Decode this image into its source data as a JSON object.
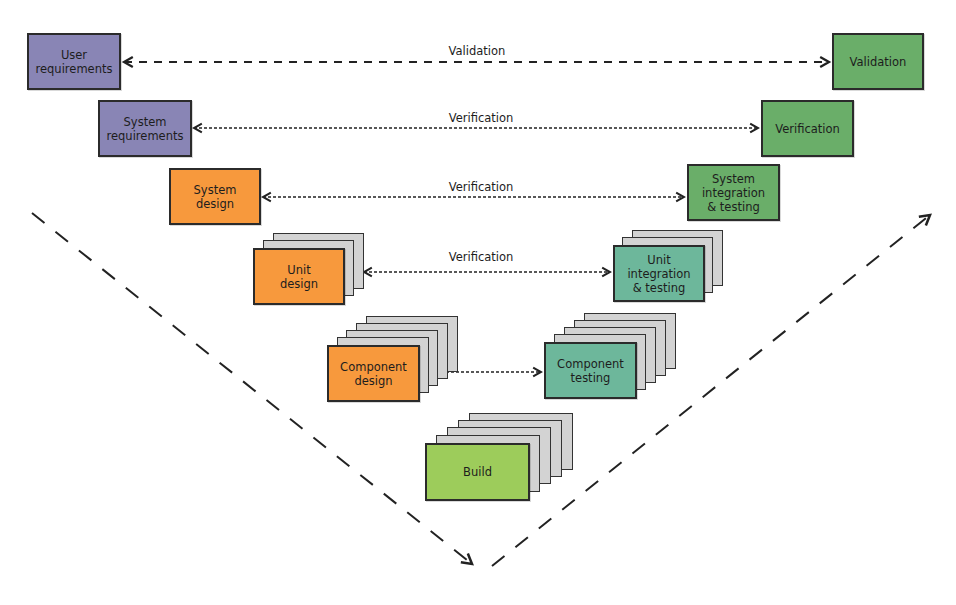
{
  "colors": {
    "requirements": "#8985b5",
    "validation": "#6aae69",
    "design": "#f7993d",
    "integration_testing": "#6db79b",
    "build": "#9dcc5b",
    "stack_sheet": "#d3d3d3",
    "line": "#222222"
  },
  "left_side": [
    {
      "id": "user-requirements",
      "label": "User\nrequirements"
    },
    {
      "id": "system-requirements",
      "label": "System\nrequirements"
    },
    {
      "id": "system-design",
      "label": "System\ndesign"
    },
    {
      "id": "unit-design",
      "label": "Unit\ndesign"
    },
    {
      "id": "component-design",
      "label": "Component\ndesign"
    }
  ],
  "right_side": [
    {
      "id": "validation",
      "label": "Validation"
    },
    {
      "id": "verification",
      "label": "Verification"
    },
    {
      "id": "system-integration-testing",
      "label": "System\nintegration\n& testing"
    },
    {
      "id": "unit-integration-testing",
      "label": "Unit\nintegration\n& testing"
    },
    {
      "id": "component-testing",
      "label": "Component\ntesting"
    }
  ],
  "bottom": {
    "id": "build",
    "label": "Build"
  },
  "connectors": [
    {
      "label": "Validation",
      "style": "dashed"
    },
    {
      "label": "Verification",
      "style": "dotted"
    },
    {
      "label": "Verification",
      "style": "dotted"
    },
    {
      "label": "Verification",
      "style": "dotted"
    },
    {
      "label": "",
      "style": "dotted"
    }
  ]
}
